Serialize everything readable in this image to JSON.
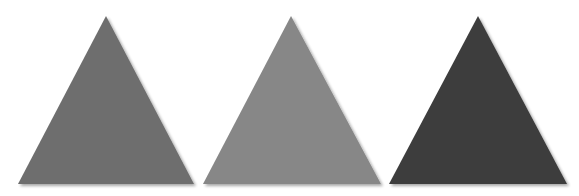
{
  "canvas": {
    "width": 579,
    "height": 196,
    "background": "#ffffff"
  },
  "shapes": [
    {
      "type": "triangle",
      "label": "gray triangle",
      "fill": "#6e6e6e",
      "points": "106,16 18,184 194,184"
    },
    {
      "type": "triangle",
      "label": "light gray triangle",
      "fill": "#878787",
      "points": "291,16 203,184 381,184"
    },
    {
      "type": "triangle",
      "label": "dark gray triangle",
      "fill": "#3c3c3c",
      "points": "478,16 389,184 567,184"
    }
  ]
}
